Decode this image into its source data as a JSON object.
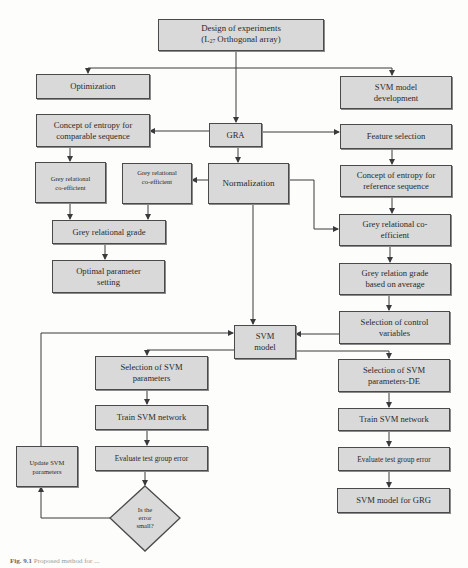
{
  "figure": {
    "type": "flowchart",
    "caption_label": "Fig. 9.1",
    "caption_text": "Proposed method for ..."
  },
  "colors": {
    "box_fill": "#d9d9d9",
    "box_border": "#4a4a4a",
    "line": "#3a3a3a",
    "background": "#fdfdfc"
  },
  "nodes": {
    "design": {
      "line1": "Design of experiments",
      "line2_prefix": "(L",
      "line2_sub": "27",
      "line2_suffix": " Orthogonal array)"
    },
    "optimization": {
      "label": "Optimization"
    },
    "svm_dev": {
      "label": "SVM model\ndevelopment"
    },
    "entropy_comp": {
      "label": "Concept of entropy for\ncomparable sequence"
    },
    "gra": {
      "label": "GRA"
    },
    "feature_sel": {
      "label": "Feature selection"
    },
    "grc_left": {
      "label": "Grey relational\nco-efficient"
    },
    "grc_mid": {
      "label": "Grey relational\nco-efficient"
    },
    "normalization": {
      "label": "Normalization"
    },
    "entropy_ref": {
      "label": "Concept of entropy for\nreference sequence"
    },
    "grg": {
      "label": "Grey relational grade"
    },
    "grc_right": {
      "label": "Grey relational co-\nefficient"
    },
    "optimal": {
      "label": "Optimal parameter\nsetting"
    },
    "grg_avg": {
      "label": "Grey relation grade\nbased on average"
    },
    "control_vars": {
      "label": "Selection of control\nvariables"
    },
    "svm_model": {
      "label": "SVM\nmodel"
    },
    "sel_svm_params": {
      "label": "Selection of SVM\nparameters"
    },
    "sel_svm_de": {
      "label": "Selection of SVM\nparameters-DE"
    },
    "train_mid": {
      "label": "Train SVM network"
    },
    "train_right": {
      "label": "Train SVM network"
    },
    "eval_mid": {
      "label": "Evaluate test group error"
    },
    "eval_right": {
      "label": "Evaluate test group error"
    },
    "update_svm": {
      "label": "Update SVM\nparameters"
    },
    "decision": {
      "label": "Is the\nerror\nsmall?"
    },
    "svm_grg": {
      "label": "SVM model for GRG"
    }
  },
  "edges": [
    {
      "from": "design",
      "to": "optimization"
    },
    {
      "from": "design",
      "to": "svm_dev"
    },
    {
      "from": "design",
      "to": "gra"
    },
    {
      "from": "gra",
      "to": "entropy_comp"
    },
    {
      "from": "gra",
      "to": "feature_sel"
    },
    {
      "from": "gra",
      "to": "normalization"
    },
    {
      "from": "entropy_comp",
      "to": "grc_left"
    },
    {
      "from": "normalization",
      "to": "grc_mid"
    },
    {
      "from": "normalization",
      "to": "grc_right"
    },
    {
      "from": "normalization",
      "to": "svm_model"
    },
    {
      "from": "grc_left",
      "to": "grg"
    },
    {
      "from": "grc_mid",
      "to": "grg"
    },
    {
      "from": "grg",
      "to": "optimal"
    },
    {
      "from": "feature_sel",
      "to": "entropy_ref"
    },
    {
      "from": "entropy_ref",
      "to": "grc_right"
    },
    {
      "from": "grc_right",
      "to": "grg_avg"
    },
    {
      "from": "grg_avg",
      "to": "control_vars"
    },
    {
      "from": "control_vars",
      "to": "svm_model"
    },
    {
      "from": "svm_model",
      "to": "sel_svm_params"
    },
    {
      "from": "svm_model",
      "to": "sel_svm_de"
    },
    {
      "from": "sel_svm_params",
      "to": "train_mid"
    },
    {
      "from": "train_mid",
      "to": "eval_mid"
    },
    {
      "from": "eval_mid",
      "to": "decision"
    },
    {
      "from": "decision",
      "to": "update_svm"
    },
    {
      "from": "update_svm",
      "to": "svm_model"
    },
    {
      "from": "sel_svm_de",
      "to": "train_right"
    },
    {
      "from": "train_right",
      "to": "eval_right"
    },
    {
      "from": "eval_right",
      "to": "svm_grg"
    }
  ]
}
